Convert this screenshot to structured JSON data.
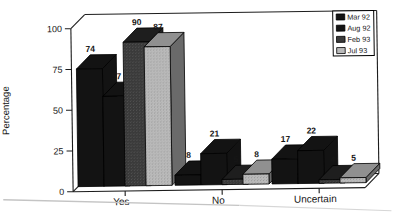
{
  "page": {
    "background": "#ffffff"
  },
  "chart_data": {
    "type": "bar",
    "style": "3d-clustered, scanned grayscale",
    "title": "",
    "xlabel": "",
    "ylabel": "Percentage",
    "categories": [
      "Yes",
      "No",
      "Uncertain"
    ],
    "series": [
      {
        "name": "Mar 92",
        "values": [
          74,
          8,
          17
        ],
        "color": "#131313",
        "color_top": "#131313",
        "color_side": "#131313",
        "stippled": false,
        "stipple_color": ""
      },
      {
        "name": "Aug 92",
        "values": [
          57,
          21,
          22
        ],
        "color": "#131313",
        "color_top": "#131313",
        "color_side": "#131313",
        "stippled": false,
        "stipple_color": ""
      },
      {
        "name": "Feb 93",
        "values": [
          90,
          5,
          4
        ],
        "color": "#3a3a3a",
        "color_top": "#1e1e1e",
        "color_side": "#232323",
        "stippled": true,
        "stipple_color": "#545454"
      },
      {
        "name": "Jul 93",
        "values": [
          87,
          8,
          5
        ],
        "color": "#bababa",
        "color_top": "#909090",
        "color_side": "#6a6a6a",
        "stippled": true,
        "stipple_color": "#999999"
      }
    ],
    "ylim": [
      0,
      100
    ],
    "yticks": [
      0,
      25,
      50,
      75,
      100
    ],
    "bar_value_labels": true,
    "legend_position": "top-right",
    "grid": false,
    "line_color": "#1c1c1c",
    "text_color": "#161616"
  }
}
